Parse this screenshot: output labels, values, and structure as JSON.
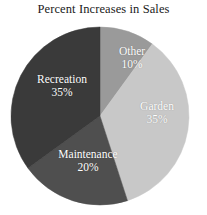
{
  "chart_data": {
    "type": "pie",
    "title": "Percent Increases in Sales",
    "xlabel": "",
    "ylabel": "",
    "legend": "none",
    "grid": false,
    "start_angle_deg": 0,
    "direction": "clockwise",
    "units": "percent",
    "total": 100,
    "categories": [
      "Other",
      "Garden",
      "Maintenance",
      "Recreation"
    ],
    "values": [
      10,
      35,
      20,
      35
    ],
    "slices": [
      {
        "label": "Other",
        "value": 10,
        "value_text": "10%",
        "color": "#9a9a9a",
        "start_deg": 0,
        "end_deg": 36,
        "label_color": "#ffffff"
      },
      {
        "label": "Garden",
        "value": 35,
        "value_text": "35%",
        "color": "#c8c8c8",
        "start_deg": 36,
        "end_deg": 162,
        "label_color": "#ffffff"
      },
      {
        "label": "Maintenance",
        "value": 20,
        "value_text": "20%",
        "color": "#4f4f4f",
        "start_deg": 162,
        "end_deg": 234,
        "label_color": "#ffffff"
      },
      {
        "label": "Recreation",
        "value": 35,
        "value_text": "35%",
        "color": "#3a3a3a",
        "start_deg": 234,
        "end_deg": 360,
        "label_color": "#ffffff"
      }
    ],
    "geometry": {
      "center_x": 100,
      "center_y": 116,
      "radius": 89
    }
  }
}
